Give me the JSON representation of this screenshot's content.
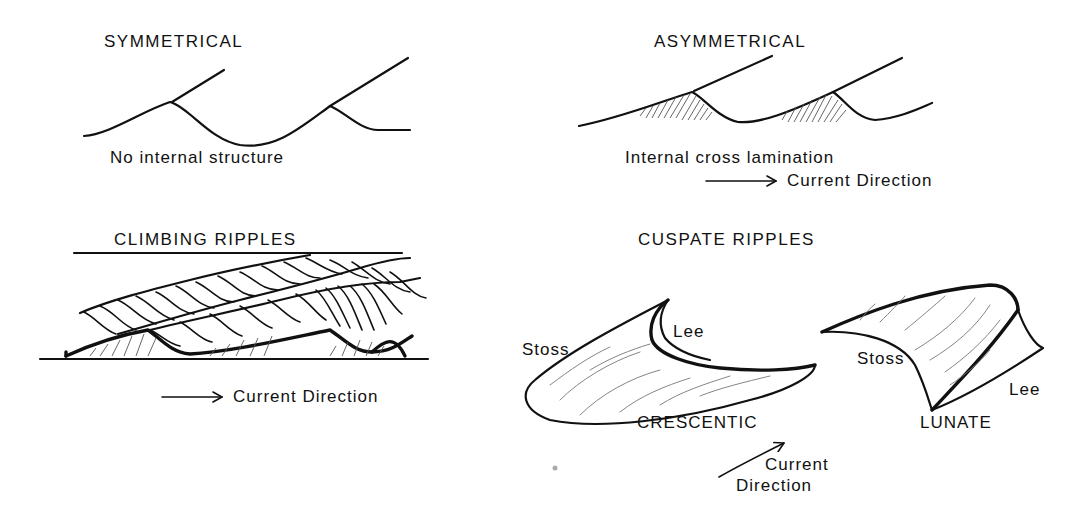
{
  "panels": {
    "symmetrical": {
      "title": "SYMMETRICAL",
      "caption": "No internal structure"
    },
    "asymmetrical": {
      "title": "ASYMMETRICAL",
      "caption": "Internal cross lamination",
      "arrow_label": "Current Direction"
    },
    "climbing": {
      "title": "CLIMBING RIPPLES",
      "arrow_label": "Current Direction"
    },
    "cuspate": {
      "title": "CUSPATE RIPPLES",
      "crescentic": {
        "name": "CRESCENTIC",
        "stoss_label": "Stoss",
        "lee_label": "Lee"
      },
      "lunate": {
        "name": "LUNATE",
        "stoss_label": "Stoss",
        "lee_label": "Lee"
      },
      "arrow_label_line1": "Current",
      "arrow_label_line2": "Direction"
    }
  }
}
